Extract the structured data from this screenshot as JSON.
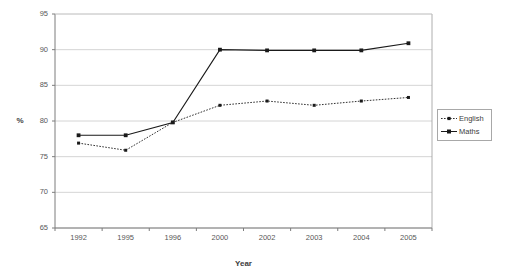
{
  "chart_data": {
    "type": "line",
    "title": "",
    "xlabel": "Year",
    "ylabel": "%",
    "categories": [
      "1992",
      "1995",
      "1996",
      "2000",
      "2002",
      "2003",
      "2004",
      "2005"
    ],
    "ylim": [
      65,
      95
    ],
    "yticks": [
      65,
      70,
      75,
      80,
      85,
      90,
      95
    ],
    "grid": true,
    "legend_position": "right",
    "series": [
      {
        "name": "English",
        "values": [
          76.9,
          75.9,
          79.8,
          82.2,
          82.8,
          82.2,
          82.8,
          83.3
        ],
        "line_style": "dotted",
        "marker": "small-square",
        "color": "#1a1a1a"
      },
      {
        "name": "Maths",
        "values": [
          78.0,
          78.0,
          79.8,
          90.0,
          89.9,
          89.9,
          89.9,
          90.9
        ],
        "line_style": "solid",
        "marker": "square",
        "color": "#1a1a1a"
      }
    ]
  },
  "axes": {
    "y_tick_labels": [
      "95",
      "90",
      "85",
      "80",
      "75",
      "70",
      "65"
    ],
    "x_tick_labels": [
      "1992",
      "1995",
      "1996",
      "2000",
      "2002",
      "2003",
      "2004",
      "2005"
    ],
    "y_axis_title": "%",
    "x_axis_title": "Year"
  },
  "legend": {
    "items": [
      {
        "label": "English"
      },
      {
        "label": "Maths"
      }
    ]
  },
  "colors": {
    "plot_border": "#9a9a9a",
    "gridline": "#c9c9c9",
    "series_line": "#1a1a1a",
    "text": "#4a4a4a",
    "background": "#ffffff"
  }
}
